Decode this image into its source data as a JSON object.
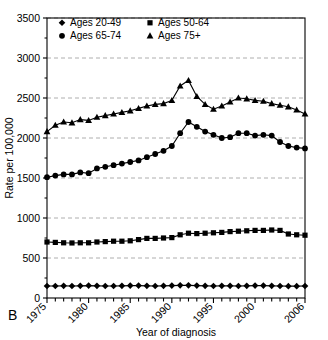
{
  "figure": {
    "panel_label": "B",
    "axis_color": "#000000",
    "grid_color": "#999999",
    "series_color": "#000000"
  },
  "axes": {
    "ylabel": "Rate per 100,000",
    "xlabel": "Year of diagnosis",
    "yticks": [
      0,
      500,
      1000,
      1500,
      2000,
      2500,
      3000,
      3500
    ],
    "ytick_labels": [
      "0",
      "500",
      "1000",
      "1500",
      "2000",
      "2500",
      "3000",
      "3500"
    ],
    "xtick_labels": [
      "1975",
      "1980",
      "1985",
      "1990",
      "1995",
      "2000",
      "2006"
    ],
    "xtick_values": [
      1975,
      1980,
      1985,
      1990,
      1995,
      2000,
      2006
    ],
    "ylim": [
      0,
      3500
    ],
    "xlim": [
      1975,
      2006
    ],
    "grid": "horizontal-dashed"
  },
  "legend": {
    "position": "top-left-inside",
    "entries": [
      {
        "label": "Ages 20-49",
        "marker": "diamond"
      },
      {
        "label": "Ages 50-64",
        "marker": "square"
      },
      {
        "label": "Ages 65-74",
        "marker": "circle"
      },
      {
        "label": "Ages 75+",
        "marker": "triangle"
      }
    ]
  },
  "chart_data": {
    "type": "line",
    "title": "",
    "xlabel": "Year of diagnosis",
    "ylabel": "Rate per 100,000",
    "xlim": [
      1975,
      2006
    ],
    "ylim": [
      0,
      3500
    ],
    "grid": true,
    "legend_position": "upper left",
    "x": [
      1975,
      1976,
      1977,
      1978,
      1979,
      1980,
      1981,
      1982,
      1983,
      1984,
      1985,
      1986,
      1987,
      1988,
      1989,
      1990,
      1991,
      1992,
      1993,
      1994,
      1995,
      1996,
      1997,
      1998,
      1999,
      2000,
      2001,
      2002,
      2003,
      2004,
      2005,
      2006
    ],
    "series": [
      {
        "name": "Ages 20-49",
        "marker": "diamond",
        "values": [
          150,
          150,
          152,
          150,
          152,
          155,
          152,
          150,
          150,
          152,
          155,
          155,
          152,
          150,
          152,
          155,
          158,
          158,
          155,
          152,
          150,
          152,
          152,
          150,
          152,
          155,
          155,
          152,
          150,
          148,
          148,
          150
        ]
      },
      {
        "name": "Ages 50-64",
        "marker": "square",
        "values": [
          700,
          695,
          690,
          688,
          690,
          690,
          700,
          705,
          710,
          710,
          715,
          730,
          745,
          745,
          750,
          755,
          790,
          810,
          805,
          810,
          815,
          820,
          830,
          835,
          840,
          845,
          845,
          850,
          845,
          800,
          790,
          785
        ]
      },
      {
        "name": "Ages 65-74",
        "marker": "circle",
        "values": [
          1510,
          1530,
          1545,
          1545,
          1570,
          1560,
          1620,
          1640,
          1660,
          1680,
          1700,
          1720,
          1760,
          1800,
          1840,
          1900,
          2060,
          2200,
          2140,
          2080,
          2040,
          2000,
          2010,
          2060,
          2060,
          2030,
          2040,
          2030,
          1950,
          1900,
          1880,
          1870
        ]
      },
      {
        "name": "Ages 75+",
        "marker": "triangle",
        "values": [
          2080,
          2160,
          2200,
          2190,
          2230,
          2220,
          2260,
          2280,
          2300,
          2320,
          2340,
          2370,
          2400,
          2420,
          2430,
          2470,
          2650,
          2720,
          2520,
          2420,
          2360,
          2400,
          2450,
          2500,
          2490,
          2470,
          2460,
          2430,
          2410,
          2390,
          2350,
          2300
        ]
      }
    ]
  }
}
